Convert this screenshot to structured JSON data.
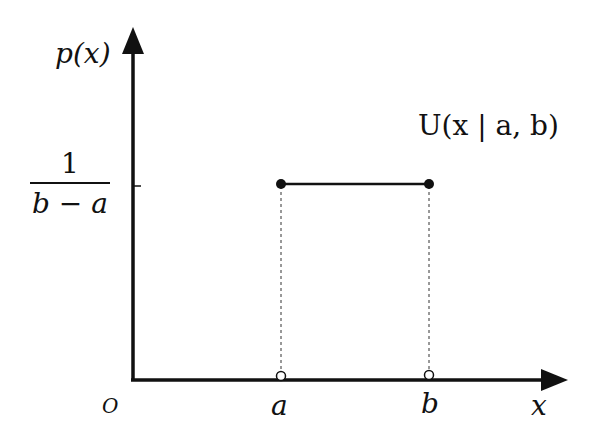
{
  "diagram": {
    "y_axis_label": "p(x)",
    "x_axis_label": "x",
    "origin_label": "O",
    "density_label": {
      "numerator": "1",
      "denominator": "b − a"
    },
    "point_a_label": "a",
    "point_b_label": "b",
    "distribution_label": "U(x | a, b)",
    "colors": {
      "ink": "#111111",
      "background": "#ffffff"
    }
  }
}
